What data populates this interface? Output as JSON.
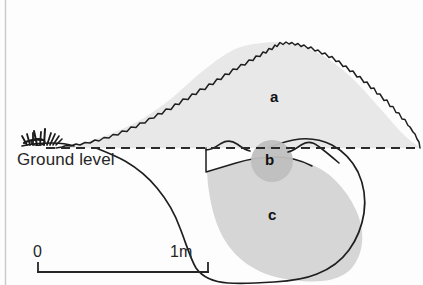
{
  "figure": {
    "width": 423,
    "height": 285,
    "background_color": "#fdfdfd"
  },
  "labels": {
    "ground_level": "Ground level",
    "region_a": "a",
    "region_b": "b",
    "region_c": "c"
  },
  "scale_bar": {
    "start_label": "0",
    "end_label": "1m",
    "start_x": 38,
    "end_x": 208,
    "baseline_y": 272,
    "tick_height": 9
  },
  "colors": {
    "mound_fill": "#e8e8e8",
    "pit_fill": "#d6d6d6",
    "nest_fill": "#bfbfbf",
    "outline": "#1f1f1f",
    "ground_line": "#2b2b2b",
    "text": "#262626",
    "page_edge": "#c9c9c9"
  },
  "geometry": {
    "ground_line_y": 148,
    "ground_line_x_start": 46,
    "ground_line_x_end": 420,
    "mound_peak_x": 281,
    "mound_peak_y": 42,
    "mound_left_x": 56,
    "mound_right_x": 420,
    "pit_bottom_y": 280,
    "nest_center_x": 272,
    "nest_center_y": 161,
    "nest_radius": 21
  },
  "elements": {
    "mound_name": "spoil-mound-region-a",
    "nest_name": "nest-chamber-region-b",
    "pit_name": "excavated-pit-region-c",
    "vegetation_name": "vegetation-tuft",
    "ground_dash_name": "ground-level-dashed-line"
  }
}
